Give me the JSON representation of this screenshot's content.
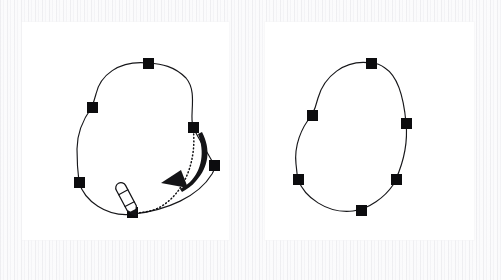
{
  "figure": {
    "background_color": "#fbfbfc",
    "panel_background": "#ffffff",
    "stroke_color": "#17171a",
    "node_color": "#0c0c0e",
    "panel_count": 2
  },
  "panels": [
    {
      "id": "panel-left",
      "label": "Dragging a node",
      "caption": "",
      "shape_name": "closed-bezier-blob-before",
      "node_count": 6,
      "nodes": [
        {
          "name": "node-top",
          "x": 126,
          "y": 41,
          "size": 11
        },
        {
          "name": "node-upper-left",
          "x": 70,
          "y": 85,
          "size": 11
        },
        {
          "name": "node-lower-left",
          "x": 57,
          "y": 160,
          "size": 11
        },
        {
          "name": "node-bottom",
          "x": 110,
          "y": 190,
          "size": 11,
          "state": "selected-dragging"
        },
        {
          "name": "node-mid-right",
          "x": 171,
          "y": 105,
          "size": 11
        },
        {
          "name": "node-right",
          "x": 192,
          "y": 143,
          "size": 11
        }
      ],
      "path_d": "M126,41 C96,38 78,54 74,72 C72,79 71,82 70,85 C62,96 55,110 55,127 C55,140 56,152 57,160 C62,178 84,196 112,192 C145,188 176,175 190,152 C195,143 192,143 192,143 C188,134 178,120 171,105 C167,93 176,70 164,56 C152,44 140,42 126,41 Z",
      "annotations": {
        "drag_trail": {
          "name": "drag-dotted-trail",
          "d": "M171,105 C175,135 165,168 140,184 C130,190 118,191 111,191",
          "style": "dotted"
        },
        "arrow": {
          "name": "drag-direction-arrow",
          "from_node": "node-mid-right",
          "to_node": "node-bottom",
          "direction": "counter-clockwise-down-left"
        },
        "cursor": {
          "name": "pencil-cursor-icon",
          "x": 111,
          "y": 190,
          "tool": "pen-tool"
        }
      }
    },
    {
      "id": "panel-right",
      "label": "Result after drag",
      "caption": "",
      "shape_name": "closed-bezier-blob-after",
      "node_count": 6,
      "nodes": [
        {
          "name": "node-top",
          "x": 106,
          "y": 41,
          "size": 11
        },
        {
          "name": "node-upper-left",
          "x": 47,
          "y": 93,
          "size": 11
        },
        {
          "name": "node-lower-left",
          "x": 33,
          "y": 157,
          "size": 11
        },
        {
          "name": "node-bottom",
          "x": 96,
          "y": 188,
          "size": 11
        },
        {
          "name": "node-lower-right",
          "x": 131,
          "y": 157,
          "size": 11
        },
        {
          "name": "node-right",
          "x": 141,
          "y": 101,
          "size": 11
        }
      ],
      "path_d": "M106,41 C79,37 59,55 53,76 C51,84 49,89 47,93 C36,106 29,124 31,142 C32,150 32,154 33,157 C39,175 62,192 88,189 C104,187 120,175 128,163 C130,160 131,158 131,157 C138,141 143,120 141,101 C139,78 134,55 120,46 C115,42 111,41 106,41 Z",
      "annotations": {}
    }
  ]
}
